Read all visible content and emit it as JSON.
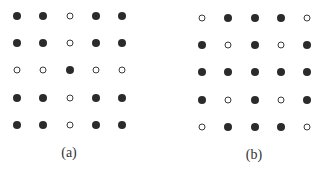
{
  "figure": {
    "panels": [
      {
        "id": "a",
        "label": "(a)",
        "origin": {
          "x": 17,
          "y": 16
        },
        "spacing": {
          "x": 26.3,
          "y": 27.2
        },
        "label_pos": {
          "x": 69,
          "y": 153
        },
        "grid": [
          [
            1,
            1,
            0,
            1,
            1
          ],
          [
            1,
            1,
            0,
            1,
            1
          ],
          [
            0,
            0,
            1,
            0,
            0
          ],
          [
            1,
            1,
            0,
            1,
            1
          ],
          [
            1,
            1,
            0,
            1,
            1
          ]
        ]
      },
      {
        "id": "b",
        "label": "(b)",
        "origin": {
          "x": 202,
          "y": 18
        },
        "spacing": {
          "x": 26.3,
          "y": 27.2
        },
        "label_pos": {
          "x": 254,
          "y": 155
        },
        "grid": [
          [
            0,
            1,
            1,
            1,
            0
          ],
          [
            1,
            0,
            1,
            0,
            1
          ],
          [
            1,
            1,
            1,
            1,
            1
          ],
          [
            1,
            0,
            1,
            0,
            1
          ],
          [
            0,
            1,
            1,
            1,
            0
          ]
        ]
      }
    ],
    "legend": {
      "filled": "filled-dot",
      "hollow": "hollow-dot"
    },
    "colors": {
      "filled": "#2b2b2b",
      "hollow_stroke": "#3a3a3a",
      "background": "#ffffff"
    }
  }
}
